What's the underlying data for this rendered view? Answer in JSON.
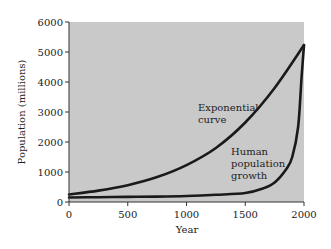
{
  "chart_data": {
    "type": "line",
    "title": "",
    "xlabel": "Year",
    "ylabel": "Population (millions)",
    "xlim": [
      0,
      2000
    ],
    "ylim": [
      0,
      6000
    ],
    "x_ticks": [
      "0",
      "500",
      "1000",
      "1500",
      "2000"
    ],
    "y_ticks": [
      "0",
      "1000",
      "2000",
      "3000",
      "4000",
      "5000",
      "6000"
    ],
    "grid": false,
    "background": "#c8c8c8",
    "series": [
      {
        "name": "Exponential curve",
        "x": [
          0,
          250,
          500,
          750,
          1000,
          1250,
          1500,
          1750,
          2000
        ],
        "values": [
          250,
          380,
          560,
          830,
          1230,
          1800,
          2650,
          3800,
          5230
        ]
      },
      {
        "name": "Human population growth",
        "x": [
          0,
          250,
          500,
          750,
          1000,
          1250,
          1500,
          1650,
          1750,
          1850,
          1900,
          1950,
          1980,
          2000
        ],
        "values": [
          150,
          160,
          170,
          180,
          200,
          240,
          300,
          450,
          650,
          1100,
          1500,
          2500,
          4200,
          5230
        ]
      }
    ],
    "annotations": [
      {
        "text": "Exponential curve",
        "lines": [
          "Exponential",
          "curve"
        ]
      },
      {
        "text": "Human population growth",
        "lines": [
          "Human",
          "population",
          "growth"
        ]
      }
    ]
  }
}
